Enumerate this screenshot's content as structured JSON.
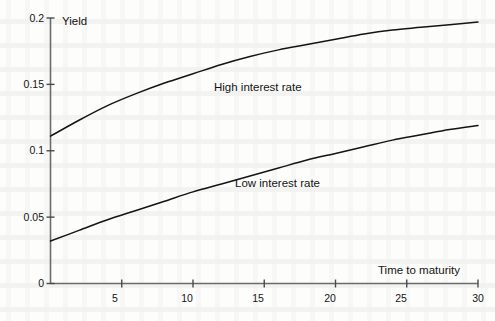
{
  "chart_data": {
    "type": "line",
    "title": "",
    "subtitle": "",
    "xlabel": "Time to maturity",
    "ylabel": "Yield",
    "xlim": [
      0,
      30
    ],
    "ylim": [
      0,
      0.2
    ],
    "grid": false,
    "legend_position": "inline-annotations",
    "x_ticks": [
      {
        "value": 5,
        "label": "5"
      },
      {
        "value": 10,
        "label": "10"
      },
      {
        "value": 15,
        "label": "15"
      },
      {
        "value": 20,
        "label": "20"
      },
      {
        "value": 25,
        "label": "25"
      },
      {
        "value": 30,
        "label": "30"
      }
    ],
    "y_ticks": [
      {
        "value": 0,
        "label": "0"
      },
      {
        "value": 0.05,
        "label": "0.05"
      },
      {
        "value": 0.1,
        "label": "0.1"
      },
      {
        "value": 0.15,
        "label": "0.15"
      },
      {
        "value": 0.2,
        "label": "0.2"
      }
    ],
    "x": [
      0,
      2,
      4,
      6,
      8,
      10,
      12,
      14,
      16,
      18,
      20,
      22,
      24,
      26,
      28,
      30
    ],
    "series": [
      {
        "name": "High interest rate",
        "color": "#141414",
        "values": [
          0.111,
          0.123,
          0.134,
          0.143,
          0.151,
          0.158,
          0.165,
          0.171,
          0.176,
          0.18,
          0.184,
          0.188,
          0.191,
          0.193,
          0.195,
          0.197
        ]
      },
      {
        "name": "Low interest rate",
        "color": "#141414",
        "values": [
          0.032,
          0.04,
          0.048,
          0.055,
          0.062,
          0.069,
          0.075,
          0.081,
          0.087,
          0.093,
          0.098,
          0.103,
          0.108,
          0.112,
          0.116,
          0.119
        ]
      }
    ],
    "annotations": [
      {
        "text": "High interest rate",
        "x": 11.5,
        "y": 0.157
      },
      {
        "text": "Low interest rate",
        "x": 14.8,
        "y": 0.085
      }
    ]
  },
  "axis_titles": {
    "y": "Yield",
    "x": "Time to maturity"
  }
}
